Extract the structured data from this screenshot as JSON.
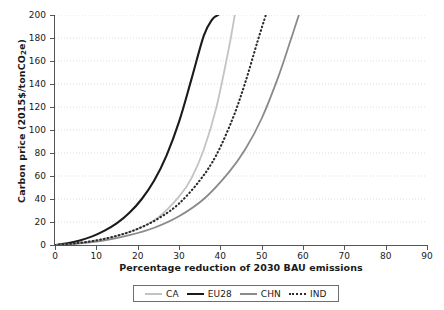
{
  "chart_data": {
    "type": "line",
    "title": "",
    "xlabel": "Percentage reduction of 2030 BAU emissions",
    "ylabel": "Carbon price (2015$/tonCO2e)",
    "ylabel_prefix": "Carbon price (2015$/tonCO",
    "ylabel_sub": "2",
    "ylabel_suffix": "e)",
    "xlim": [
      0,
      90
    ],
    "ylim": [
      0,
      200
    ],
    "xticks": [
      0,
      10,
      20,
      30,
      40,
      50,
      60,
      70,
      80,
      90
    ],
    "yticks": [
      0,
      20,
      40,
      60,
      80,
      100,
      120,
      140,
      160,
      180,
      200
    ],
    "grid": "horizontal-dotted",
    "grid_color": "#dddddd",
    "legend_position": "below-axis-centered",
    "series": [
      {
        "name": "CA",
        "color": "#c3c3c3",
        "style": "solid",
        "width": 1.8,
        "x": [
          0,
          5,
          10,
          15,
          20,
          25,
          30,
          33,
          36,
          39,
          42,
          43.5
        ],
        "y": [
          0,
          1.5,
          4,
          8,
          14,
          24,
          42,
          58,
          83,
          119,
          170,
          200
        ]
      },
      {
        "name": "EU28",
        "color": "#1b1b1b",
        "style": "solid",
        "width": 2.1,
        "x": [
          0,
          3,
          6,
          9,
          12,
          15,
          18,
          21,
          24,
          27,
          30,
          33,
          36,
          38,
          39.5
        ],
        "y": [
          0,
          1.5,
          4,
          7.5,
          12.5,
          19,
          28,
          40,
          56,
          78,
          107,
          144,
          182,
          196,
          200
        ]
      },
      {
        "name": "CHN",
        "color": "#8a8a8a",
        "style": "solid",
        "width": 1.8,
        "x": [
          0,
          6,
          12,
          18,
          24,
          30,
          36,
          42,
          46,
          50,
          54,
          57,
          59
        ],
        "y": [
          0,
          1.5,
          4,
          8.5,
          15,
          25,
          40,
          63,
          83,
          110,
          146,
          178,
          200
        ]
      },
      {
        "name": "IND",
        "color": "#2b2b2b",
        "style": "dotted",
        "width": 2.1,
        "x": [
          0,
          5,
          10,
          15,
          20,
          25,
          30,
          35,
          39,
          43,
          46,
          49,
          51
        ],
        "y": [
          0,
          1.5,
          4,
          8,
          14,
          23,
          36,
          56,
          78,
          110,
          141,
          177,
          200
        ]
      }
    ]
  },
  "axes": {
    "ytick_labels": [
      "200",
      "180",
      "160",
      "140",
      "120",
      "100",
      "80",
      "60",
      "40",
      "20",
      "0"
    ],
    "xtick_labels": [
      "0",
      "10",
      "20",
      "30",
      "40",
      "50",
      "60",
      "70",
      "80",
      "90"
    ]
  },
  "legend": {
    "items": [
      {
        "label": "CA",
        "color": "#c3c3c3",
        "style": "solid"
      },
      {
        "label": "EU28",
        "color": "#1b1b1b",
        "style": "solid"
      },
      {
        "label": "CHN",
        "color": "#8a8a8a",
        "style": "solid"
      },
      {
        "label": "IND",
        "color": "#2b2b2b",
        "style": "dotted"
      }
    ]
  }
}
